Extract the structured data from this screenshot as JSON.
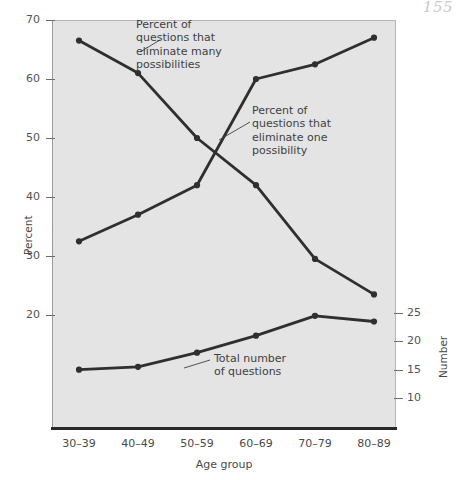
{
  "page": {
    "number": "155"
  },
  "chart_data": {
    "type": "line",
    "title": "",
    "subtitle": "",
    "xlabel": "Age group",
    "ylabel": "Percent",
    "y2label": "Number",
    "categories": [
      "30–39",
      "40–49",
      "50–59",
      "60–69",
      "70–79",
      "80–89"
    ],
    "ylim": [
      13.5,
      70
    ],
    "yticks": [
      20,
      30,
      40,
      50,
      60,
      70
    ],
    "ytick_labels": [
      "20",
      "30",
      "40",
      "50",
      "60",
      "70"
    ],
    "y2lim": [
      5.5,
      30
    ],
    "y2ticks": [
      10,
      15,
      20,
      25
    ],
    "y2tick_labels": [
      "10",
      "15",
      "20",
      "25"
    ],
    "grid": false,
    "legend": "annotations-inline",
    "series": [
      {
        "name": "Percent of questions that eliminate many possibilities",
        "axis": "left",
        "unit": "percent",
        "values": [
          66.5,
          61.0,
          50.0,
          42.0,
          29.5,
          23.5
        ]
      },
      {
        "name": "Percent of questions that eliminate one possibility",
        "axis": "left",
        "unit": "percent",
        "values": [
          32.5,
          37.0,
          42.0,
          60.0,
          62.5,
          67.0
        ]
      },
      {
        "name": "Total number of questions",
        "axis": "right",
        "unit": "count",
        "values": [
          15.0,
          15.5,
          18.0,
          21.0,
          24.5,
          23.5
        ]
      }
    ],
    "annotations": [
      {
        "id": "annotation-eliminate-many",
        "text": "Percent of\nquestions that\neliminate many\npossibilities",
        "series": "Percent of questions that eliminate many possibilities"
      },
      {
        "id": "annotation-eliminate-one",
        "text": "Percent of\nquestions that\neliminate one\npossibility",
        "series": "Percent of questions that eliminate one possibility"
      },
      {
        "id": "annotation-total-questions",
        "text": "Total number\nof questions",
        "series": "Total number of questions"
      }
    ],
    "colors": {
      "plot_background": "#e4e4e4",
      "page_background": "#ffffff",
      "series_line": "#2f2f2f",
      "axis": "#2a2a2a",
      "tick_text": "#545454"
    }
  }
}
